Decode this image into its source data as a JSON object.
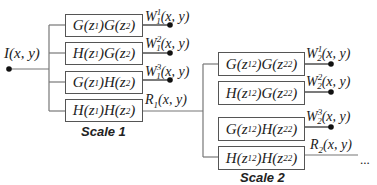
{
  "input": {
    "label_main": "I",
    "label_args": "(x, y)"
  },
  "scale1": {
    "title": "Scale 1",
    "boxes": [
      {
        "a": "G",
        "b": "G",
        "z1": "z",
        "s1": "1",
        "z2": "z",
        "s2": "2"
      },
      {
        "a": "H",
        "b": "G",
        "z1": "z",
        "s1": "1",
        "z2": "z",
        "s2": "2"
      },
      {
        "a": "G",
        "b": "H",
        "z1": "z",
        "s1": "1",
        "z2": "z",
        "s2": "2"
      },
      {
        "a": "H",
        "b": "H",
        "z1": "z",
        "s1": "1",
        "z2": "z",
        "s2": "2"
      }
    ],
    "outputs": [
      {
        "sym": "W",
        "sub": "1",
        "sup": "1",
        "args": "(x, y)"
      },
      {
        "sym": "W",
        "sub": "1",
        "sup": "2",
        "args": "(x, y)"
      },
      {
        "sym": "W",
        "sub": "1",
        "sup": "3",
        "args": "(x, y)"
      },
      {
        "sym": "R",
        "sub": "1",
        "sup": "",
        "args": "(x, y)"
      }
    ]
  },
  "scale2": {
    "title": "Scale 2",
    "power": "2",
    "boxes": [
      {
        "a": "G",
        "b": "G",
        "s1": "1",
        "s2": "2"
      },
      {
        "a": "H",
        "b": "G",
        "s1": "1",
        "s2": "2"
      },
      {
        "a": "G",
        "b": "H",
        "s1": "1",
        "s2": "2"
      },
      {
        "a": "H",
        "b": "H",
        "s1": "1",
        "s2": "2"
      }
    ],
    "outputs": [
      {
        "sym": "W",
        "sub": "2",
        "sup": "1",
        "args": "(x, y)"
      },
      {
        "sym": "W",
        "sub": "2",
        "sup": "2",
        "args": "(x, y)"
      },
      {
        "sym": "W",
        "sub": "2",
        "sup": "3",
        "args": "(x, y)"
      },
      {
        "sym": "R",
        "sub": "2",
        "sup": "",
        "args": "(x, y)"
      }
    ]
  },
  "continuation": "..."
}
